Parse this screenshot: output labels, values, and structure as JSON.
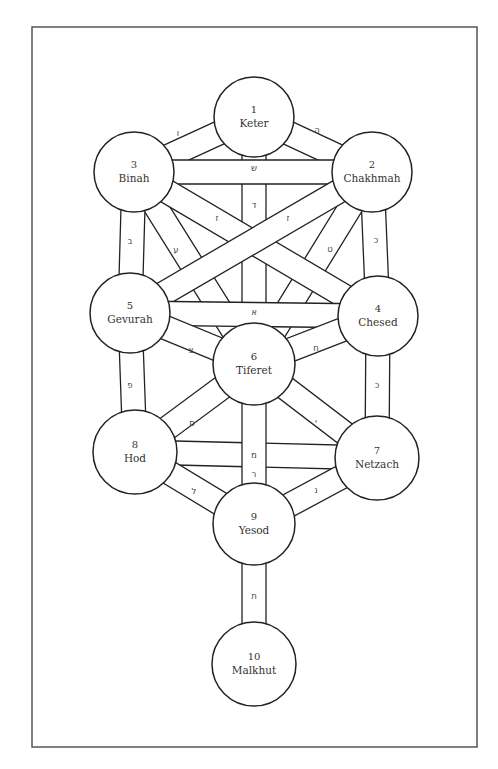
{
  "diagram": {
    "frame": {
      "x": 32,
      "y": 27,
      "width": 445,
      "height": 720,
      "stroke": "#555555"
    },
    "colors": {
      "line": "#222222",
      "text": "#333333",
      "background": "#ffffff"
    },
    "sefirot": [
      {
        "id": 1,
        "num": "1",
        "name": "Keter",
        "cx": 254,
        "cy": 117,
        "r": 40
      },
      {
        "id": 2,
        "num": "2",
        "name": "Chakhmah",
        "cx": 372,
        "cy": 172,
        "r": 40
      },
      {
        "id": 3,
        "num": "3",
        "name": "Binah",
        "cx": 134,
        "cy": 172,
        "r": 40
      },
      {
        "id": 4,
        "num": "4",
        "name": "Chesed",
        "cx": 378,
        "cy": 316,
        "r": 40
      },
      {
        "id": 5,
        "num": "5",
        "name": "Gevurah",
        "cx": 130,
        "cy": 313,
        "r": 40
      },
      {
        "id": 6,
        "num": "6",
        "name": "Tiferet",
        "cx": 254,
        "cy": 364,
        "r": 41
      },
      {
        "id": 7,
        "num": "7",
        "name": "Netzach",
        "cx": 377,
        "cy": 458,
        "r": 42
      },
      {
        "id": 8,
        "num": "8",
        "name": "Hod",
        "cx": 135,
        "cy": 452,
        "r": 42
      },
      {
        "id": 9,
        "num": "9",
        "name": "Yesod",
        "cx": 254,
        "cy": 524,
        "r": 41
      },
      {
        "id": 10,
        "num": "10",
        "name": "Malkhut",
        "cx": 254,
        "cy": 664,
        "r": 42
      }
    ],
    "paths": [
      {
        "from": 1,
        "to": 3,
        "letter": "ו",
        "lx": 178,
        "ly": 133
      },
      {
        "from": 1,
        "to": 2,
        "letter": "ה",
        "lx": 317,
        "ly": 130
      },
      {
        "from": 1,
        "to": 6,
        "letter": "ד",
        "lx": 254,
        "ly": 205
      },
      {
        "from": 3,
        "to": 2,
        "letter": "ש",
        "lx": 254,
        "ly": 168
      },
      {
        "from": 3,
        "to": 6,
        "letter": "ז",
        "lx": 217,
        "ly": 218
      },
      {
        "from": 2,
        "to": 6,
        "letter": "ז",
        "lx": 288,
        "ly": 218
      },
      {
        "from": 3,
        "to": 4,
        "letter": "ע",
        "lx": 176,
        "ly": 250
      },
      {
        "from": 2,
        "to": 5,
        "letter": "ט",
        "lx": 330,
        "ly": 249
      },
      {
        "from": 3,
        "to": 5,
        "letter": "ב",
        "lx": 130,
        "ly": 241
      },
      {
        "from": 2,
        "to": 4,
        "letter": "כ",
        "lx": 376,
        "ly": 240
      },
      {
        "from": 5,
        "to": 4,
        "letter": "א",
        "lx": 254,
        "ly": 312
      },
      {
        "from": 5,
        "to": 6,
        "letter": "צ",
        "lx": 191,
        "ly": 350
      },
      {
        "from": 4,
        "to": 6,
        "letter": "ח",
        "lx": 316,
        "ly": 348
      },
      {
        "from": 5,
        "to": 8,
        "letter": "פ",
        "lx": 130,
        "ly": 385
      },
      {
        "from": 4,
        "to": 7,
        "letter": "כ",
        "lx": 377,
        "ly": 385
      },
      {
        "from": 6,
        "to": 8,
        "letter": "ס",
        "lx": 192,
        "ly": 423
      },
      {
        "from": 6,
        "to": 7,
        "letter": "י",
        "lx": 316,
        "ly": 422
      },
      {
        "from": 8,
        "to": 7,
        "letter": "מ",
        "lx": 254,
        "ly": 455
      },
      {
        "from": 6,
        "to": 9,
        "letter": "ר",
        "lx": 254,
        "ly": 474
      },
      {
        "from": 8,
        "to": 9,
        "letter": "ל",
        "lx": 194,
        "ly": 491
      },
      {
        "from": 7,
        "to": 9,
        "letter": "נ",
        "lx": 316,
        "ly": 490
      },
      {
        "from": 9,
        "to": 10,
        "letter": "ת",
        "lx": 254,
        "ly": 596
      }
    ],
    "band_width": 24
  }
}
